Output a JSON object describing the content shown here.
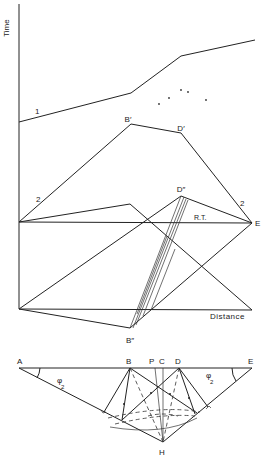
{
  "upper_figure": {
    "y_axis_label": "Time",
    "x_axis_label": "Distance",
    "curve_labels": [
      "1",
      "2",
      "2"
    ],
    "points": {
      "B_prime": "B′",
      "D_prime": "D′",
      "D_double": "D″",
      "B_double": "B″",
      "E": "E"
    },
    "reference_label": "R.T."
  },
  "lower_figure": {
    "points": {
      "A": "A",
      "B": "B",
      "P": "P",
      "C": "C",
      "D": "D",
      "E": "E",
      "H": "H"
    },
    "angle_left": "φ",
    "angle_left_sub": "2",
    "angle_right": "φ",
    "angle_right_sub": "2"
  }
}
